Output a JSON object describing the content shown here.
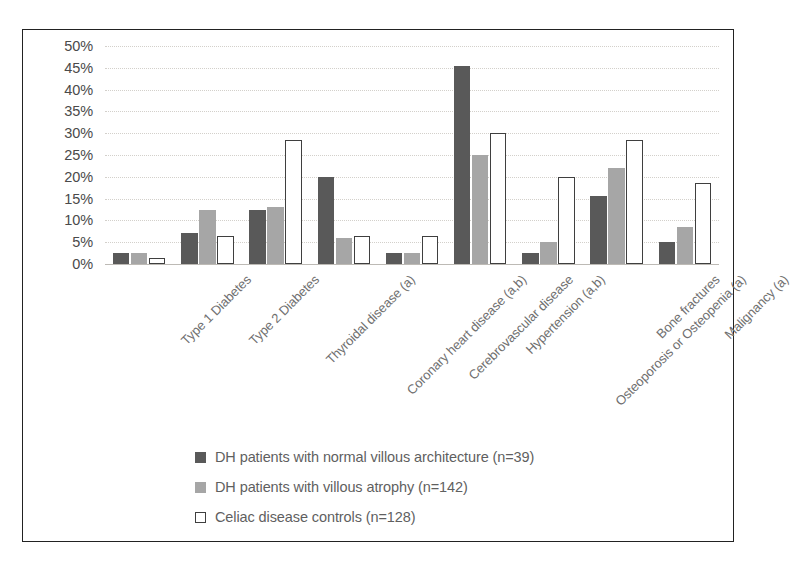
{
  "chart_data": {
    "type": "bar",
    "title": "",
    "subtitle": "",
    "xlabel": "",
    "ylabel": "",
    "ylim": [
      0,
      50
    ],
    "ytick_labels": [
      "50%",
      "45%",
      "40%",
      "35%",
      "30%",
      "25%",
      "20%",
      "15%",
      "10%",
      "5%",
      "0%"
    ],
    "ytick_values": [
      50,
      45,
      40,
      35,
      30,
      25,
      20,
      15,
      10,
      5,
      0
    ],
    "grid": true,
    "legend_position": "bottom",
    "categories": [
      "Type 1 Diabetes",
      "Type 2 Diabetes",
      "Thyroidal disease (a)",
      "Coronary heart disease (a,b)",
      "Cerebrovascular disease",
      "Hypertension (a,b)",
      "Osteoporosis or Osteopenia (a)",
      "Bone fractures",
      "Malignancy (a)"
    ],
    "series": [
      {
        "name": "DH patients with normal villous architecture (n=39)",
        "color": "#595959",
        "values": [
          2.5,
          7.0,
          12.5,
          20.0,
          2.5,
          45.5,
          2.5,
          15.5,
          5.0
        ]
      },
      {
        "name": "DH patients with villous atrophy (n=142)",
        "color": "#a6a6a6",
        "values": [
          2.5,
          12.5,
          13.0,
          6.0,
          2.5,
          25.0,
          5.0,
          22.0,
          8.5
        ]
      },
      {
        "name": "Celiac disease controls (n=128)",
        "color": "#ffffff",
        "values": [
          1.3,
          6.5,
          28.5,
          6.5,
          6.5,
          30.0,
          20.0,
          28.5,
          18.5
        ]
      }
    ]
  },
  "legend": {
    "items": [
      {
        "swatch": "dark-gray-square",
        "label": "DH patients with normal villous architecture (n=39)"
      },
      {
        "swatch": "medium-gray-square",
        "label": "DH patients with villous atrophy (n=142)"
      },
      {
        "swatch": "white-outlined-square",
        "label": "Celiac disease controls (n=128)"
      }
    ]
  }
}
